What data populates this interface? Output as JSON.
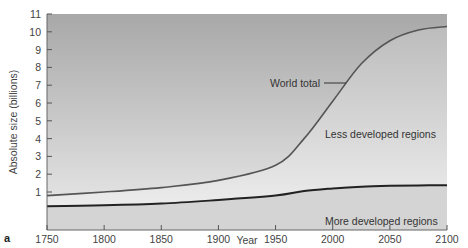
{
  "chart_data": {
    "type": "area",
    "title": "",
    "panel_label": "a",
    "xlabel": "Year",
    "ylabel": "Absolute size (billions)",
    "xlim": [
      1750,
      2100
    ],
    "ylim": [
      0,
      11
    ],
    "x_ticks": [
      "1750",
      "1800",
      "1850",
      "1900",
      "1950",
      "2000",
      "2050",
      "2100"
    ],
    "y_ticks": [
      "1",
      "2",
      "3",
      "4",
      "5",
      "6",
      "7",
      "8",
      "9",
      "10",
      "11"
    ],
    "grid": false,
    "x": [
      1750,
      1800,
      1850,
      1900,
      1950,
      1975,
      2000,
      2025,
      2050,
      2075,
      2100
    ],
    "series": [
      {
        "name": "World total",
        "values": [
          0.8,
          1.0,
          1.25,
          1.65,
          2.5,
          4.0,
          6.1,
          8.2,
          9.5,
          10.1,
          10.3
        ]
      },
      {
        "name": "More developed regions",
        "values": [
          0.2,
          0.25,
          0.35,
          0.55,
          0.8,
          1.05,
          1.2,
          1.3,
          1.35,
          1.37,
          1.38
        ]
      }
    ],
    "annotations": [
      "World total",
      "Less developed regions",
      "More developed regions"
    ]
  }
}
